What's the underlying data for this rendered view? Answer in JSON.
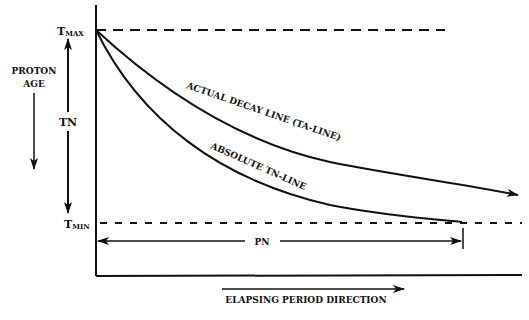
{
  "diagram": {
    "y_axis_label_line1": "PROTON",
    "y_axis_label_line2": "AGE",
    "t_max_label": "T",
    "t_max_sub": "MAX",
    "t_min_label": "T",
    "t_min_sub": "MIN",
    "tn_label": "TN",
    "pn_label": "PN",
    "curve_actual_label": "ACTUAL DECAY LINE  (TA-LINE)",
    "curve_absolute_label": "ABSOLUTE  TN-LINE",
    "x_axis_label": "ELAPSING PERIOD DIRECTION",
    "colors": {
      "ink": "#111111",
      "background": "#ffffff"
    }
  }
}
